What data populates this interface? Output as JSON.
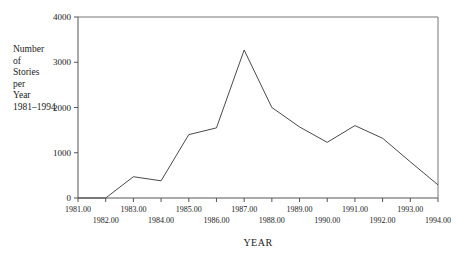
{
  "chart_data": {
    "type": "line",
    "title": "",
    "xlabel": "YEAR",
    "ylabel": "Number of Stories per Year 1981–1994",
    "ylabel_lines": [
      "Number",
      "of",
      "Stories",
      "per",
      "Year",
      "1981–1994"
    ],
    "categories": [
      1981,
      1982,
      1983,
      1984,
      1985,
      1986,
      1987,
      1988,
      1989,
      1990,
      1991,
      1992,
      1993,
      1994
    ],
    "values": [
      0,
      0,
      470,
      380,
      1400,
      1550,
      3270,
      2000,
      1570,
      1230,
      1600,
      1320,
      800,
      290
    ],
    "series": [
      {
        "name": "Stories per year",
        "values": [
          0,
          0,
          470,
          380,
          1400,
          1550,
          3270,
          2000,
          1570,
          1230,
          1600,
          1320,
          800,
          290
        ]
      }
    ],
    "x": [
      1981,
      1982,
      1983,
      1984,
      1985,
      1986,
      1987,
      1988,
      1989,
      1990,
      1991,
      1992,
      1993,
      1994
    ],
    "xlim": [
      1981,
      1994
    ],
    "ylim": [
      0,
      4000
    ],
    "yticks": [
      0,
      1000,
      2000,
      3000,
      4000
    ],
    "ytick_labels": [
      "0",
      "1000",
      "2000",
      "3000",
      "4000"
    ],
    "xticks": [
      1981,
      1982,
      1983,
      1984,
      1985,
      1986,
      1987,
      1988,
      1989,
      1990,
      1991,
      1992,
      1993,
      1994
    ],
    "xtick_labels": [
      "1981.00",
      "1982.00",
      "1983.00",
      "1984.00",
      "1985.00",
      "1986.00",
      "1987.00",
      "1988.00",
      "1989.00",
      "1990.00",
      "1991.00",
      "1992.00",
      "1993.00",
      "1994.00"
    ],
    "xtick_rows": [
      0,
      1,
      0,
      1,
      0,
      1,
      0,
      1,
      0,
      1,
      0,
      1,
      0,
      1
    ],
    "grid": false,
    "legend": false,
    "legend_position": "none",
    "line_color": "#4a4a4a",
    "axis_color": "#555555",
    "background_color": "#ffffff"
  }
}
